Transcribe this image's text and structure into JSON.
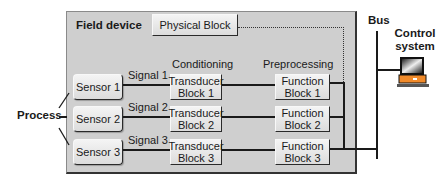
{
  "diagram": {
    "field_device": {
      "title": "Field device"
    },
    "physical_block": {
      "label": "Physical Block"
    },
    "column_headers": {
      "conditioning": "Conditioning",
      "preprocessing": "Preprocessing"
    },
    "process": {
      "label": "Process"
    },
    "bus": {
      "label": "Bus"
    },
    "control_system": {
      "line1": "Control",
      "line2": "system"
    },
    "channels": [
      {
        "sensor": "Sensor 1",
        "signal": "Signal 1",
        "transducer_l1": "Transducer",
        "transducer_l2": "Block 1",
        "function_l1": "Function",
        "function_l2": "Block 1"
      },
      {
        "sensor": "Sensor 2",
        "signal": "Signal 2",
        "transducer_l1": "Transducer",
        "transducer_l2": "Block 2",
        "function_l1": "Function",
        "function_l2": "Block 2"
      },
      {
        "sensor": "Sensor 3",
        "signal": "Signal 3",
        "transducer_l1": "Transducer",
        "transducer_l2": "Block 3",
        "function_l1": "Function",
        "function_l2": "Block 3"
      }
    ],
    "colors": {
      "field_device_bg": "#cfcfcf",
      "line": "#1a1a1a",
      "monitor_body": "#f08a2a"
    }
  }
}
